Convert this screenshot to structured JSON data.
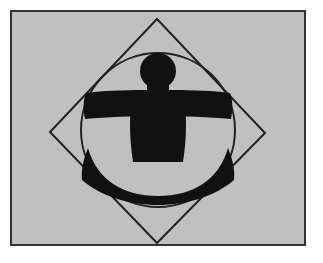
{
  "image": {
    "title": "Vitruvian-style figure in circle and rotated square",
    "width": 323,
    "height": 263,
    "alt_text": "Black silhouette of a stylized human figure with outstretched arms and spread legs, enclosed by a thin circle and a rotated square (diamond), on a light gray panel with a dark border"
  },
  "colors": {
    "page_background": "#ffffff",
    "panel_background": "#c0c0c0",
    "frame_stroke": "#333333",
    "outline_stroke": "#222222",
    "figure_fill": "#111111"
  },
  "frame": {
    "label": "panel-frame",
    "x": 10,
    "y": 10,
    "width": 296,
    "height": 236,
    "stroke_width": 2
  },
  "geometry": {
    "diamond": {
      "label": "rotated-square",
      "points": "157,19 265,133 157,243 50,132",
      "stroke_width": 2,
      "vertices": {
        "top": [
          157,
          19
        ],
        "right": [
          265,
          133
        ],
        "bottom": [
          157,
          243
        ],
        "left": [
          50,
          132
        ]
      }
    },
    "circle": {
      "label": "enclosing-circle",
      "cx": 158,
      "cy": 130,
      "r": 77,
      "stroke_width": 2
    },
    "figure": {
      "label": "human-silhouette",
      "head": {
        "cx": 158,
        "cy": 71,
        "rx": 18,
        "ry": 18
      },
      "arms": {
        "left_x": 84,
        "right_x": 233,
        "top_y": 94,
        "bottom_y": 119
      },
      "torso_path": "M 132,94 L 184,94 C 186,118 186,140 182,160 L 134,160 C 130,140 130,118 132,94 Z",
      "legs_path": "M 88,150 C 96,182 122,198 158,198 C 194,198 220,182 229,150 C 233,163 234,172 233,180 C 214,195 188,204 158,204 C 128,204 101,195 83,180 C 82,172 83,163 88,150 Z"
    }
  },
  "labels": {
    "figure_name": "vitruvian-figure",
    "panel_name": "image-panel"
  }
}
